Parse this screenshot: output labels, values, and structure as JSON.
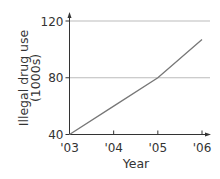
{
  "chart_data": {
    "type": "line",
    "title": "",
    "xlabel": "Year",
    "ylabel": "Illegal drug use",
    "ylabel_unit": "(1000s)",
    "categories": [
      "'03",
      "'04",
      "'05",
      "'06"
    ],
    "series": [
      {
        "name": "Illegal drug use",
        "values": [
          40,
          60,
          80,
          107
        ]
      }
    ],
    "yticks": [
      40,
      80,
      120
    ],
    "ylim": [
      40,
      120
    ],
    "grid": "horizontal",
    "legend": "none",
    "colors": {
      "line": "#777777",
      "grid": "#aaaaaa",
      "axis": "#333333"
    }
  }
}
